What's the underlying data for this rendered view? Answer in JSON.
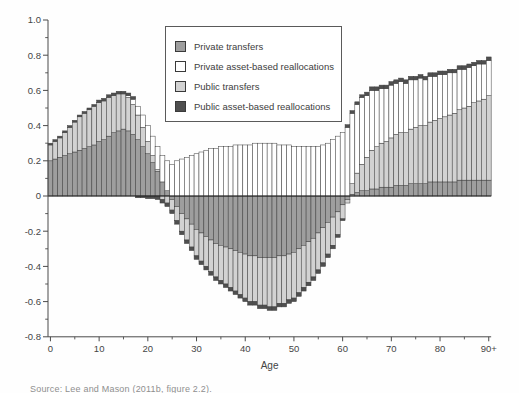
{
  "figure": {
    "source_note": "Source: Lee and Mason (2011b, figure 2.2)."
  },
  "colors": {
    "private_transfers": "#9e9e9e",
    "private_abr": "#ffffff",
    "public_transfers": "#d2d2d2",
    "public_abr": "#4f4f4f",
    "outline": "#3c3c3c",
    "axis": "#4a4a4a",
    "zero_line": "#222222",
    "text": "#454545"
  },
  "legend": {
    "items": [
      {
        "label": "Private transfers",
        "color_key": "private_transfers"
      },
      {
        "label": "Private asset-based reallocations",
        "color_key": "private_abr"
      },
      {
        "label": "Public transfers",
        "color_key": "public_transfers"
      },
      {
        "label": "Public asset-based reallocations",
        "color_key": "public_abr"
      }
    ]
  },
  "chart_data": {
    "type": "bar",
    "stacked": true,
    "title": "",
    "xlabel": "Age",
    "ylabel": "",
    "ylim": [
      -0.8,
      1.0
    ],
    "grid": false,
    "legend_position": "top-center-inside",
    "x_tick_ages": [
      0,
      10,
      20,
      30,
      40,
      50,
      60,
      70,
      80,
      90
    ],
    "x_tick_labels": [
      "0",
      "10",
      "20",
      "30",
      "40",
      "50",
      "60",
      "70",
      "80",
      "90+"
    ],
    "x_minor_tick_ages": [
      5,
      15,
      25,
      35,
      45,
      55,
      65,
      75,
      85
    ],
    "y_tick_values": [
      1.0,
      0.8,
      0.6,
      0.4,
      0.2,
      0,
      -0.2,
      -0.4,
      -0.6,
      -0.8
    ],
    "y_tick_labels": [
      "1.0",
      "0.8",
      "0.6",
      "0.4",
      "0.2",
      "0",
      "-0.2",
      "-0.4",
      "-0.6",
      "-0.8"
    ],
    "y_minor_tick_values": [
      0.9,
      0.7,
      0.5,
      0.3,
      0.1,
      -0.1,
      -0.3,
      -0.5,
      -0.7
    ],
    "ages": [
      0,
      1,
      2,
      3,
      4,
      5,
      6,
      7,
      8,
      9,
      10,
      11,
      12,
      13,
      14,
      15,
      16,
      17,
      18,
      19,
      20,
      21,
      22,
      23,
      24,
      25,
      26,
      27,
      28,
      29,
      30,
      31,
      32,
      33,
      34,
      35,
      36,
      37,
      38,
      39,
      40,
      41,
      42,
      43,
      44,
      45,
      46,
      47,
      48,
      49,
      50,
      51,
      52,
      53,
      54,
      55,
      56,
      57,
      58,
      59,
      60,
      61,
      62,
      63,
      64,
      65,
      66,
      67,
      68,
      69,
      70,
      71,
      72,
      73,
      74,
      75,
      76,
      77,
      78,
      79,
      80,
      81,
      82,
      83,
      84,
      85,
      86,
      87,
      88,
      89,
      90
    ],
    "stack_order": [
      "Private transfers",
      "Public transfers",
      "Private asset-based reallocations",
      "Public asset-based reallocations"
    ],
    "series": [
      {
        "name": "Private transfers",
        "color_key": "private_transfers",
        "values": [
          0.2,
          0.21,
          0.22,
          0.23,
          0.24,
          0.25,
          0.26,
          0.27,
          0.28,
          0.29,
          0.31,
          0.32,
          0.34,
          0.36,
          0.37,
          0.38,
          0.37,
          0.35,
          0.32,
          0.28,
          0.24,
          0.19,
          0.14,
          0.08,
          0.03,
          -0.02,
          -0.06,
          -0.1,
          -0.13,
          -0.16,
          -0.19,
          -0.21,
          -0.23,
          -0.25,
          -0.27,
          -0.28,
          -0.29,
          -0.3,
          -0.31,
          -0.32,
          -0.33,
          -0.34,
          -0.34,
          -0.35,
          -0.35,
          -0.35,
          -0.35,
          -0.34,
          -0.34,
          -0.33,
          -0.32,
          -0.3,
          -0.28,
          -0.26,
          -0.24,
          -0.21,
          -0.18,
          -0.15,
          -0.12,
          -0.09,
          -0.05,
          -0.02,
          0.01,
          0.02,
          0.03,
          0.03,
          0.04,
          0.04,
          0.05,
          0.05,
          0.05,
          0.06,
          0.06,
          0.06,
          0.07,
          0.07,
          0.07,
          0.07,
          0.08,
          0.08,
          0.08,
          0.08,
          0.08,
          0.08,
          0.09,
          0.09,
          0.09,
          0.09,
          0.09,
          0.09,
          0.09
        ]
      },
      {
        "name": "Private asset-based reallocations",
        "color_key": "private_abr",
        "values": [
          0,
          0,
          0,
          0,
          0,
          0,
          0,
          0,
          0,
          0,
          0,
          0,
          0,
          0,
          0,
          0,
          0.01,
          0.03,
          0.05,
          0.07,
          0.09,
          0.11,
          0.13,
          0.15,
          0.17,
          0.18,
          0.2,
          0.21,
          0.22,
          0.23,
          0.24,
          0.25,
          0.26,
          0.27,
          0.27,
          0.28,
          0.28,
          0.28,
          0.29,
          0.29,
          0.29,
          0.29,
          0.3,
          0.3,
          0.3,
          0.3,
          0.3,
          0.29,
          0.29,
          0.29,
          0.28,
          0.28,
          0.28,
          0.28,
          0.28,
          0.28,
          0.29,
          0.3,
          0.32,
          0.34,
          0.36,
          0.39,
          0.4,
          0.39,
          0.38,
          0.35,
          0.34,
          0.32,
          0.31,
          0.3,
          0.3,
          0.29,
          0.29,
          0.28,
          0.28,
          0.27,
          0.27,
          0.26,
          0.26,
          0.25,
          0.25,
          0.24,
          0.24,
          0.23,
          0.23,
          0.22,
          0.22,
          0.21,
          0.21,
          0.2,
          0.2
        ]
      },
      {
        "name": "Public transfers",
        "color_key": "public_transfers",
        "values": [
          0.09,
          0.1,
          0.11,
          0.13,
          0.15,
          0.17,
          0.19,
          0.2,
          0.21,
          0.22,
          0.22,
          0.22,
          0.22,
          0.21,
          0.21,
          0.2,
          0.19,
          0.17,
          0.14,
          0.11,
          0.07,
          0.04,
          0.01,
          -0.02,
          -0.04,
          -0.06,
          -0.08,
          -0.1,
          -0.12,
          -0.13,
          -0.15,
          -0.16,
          -0.17,
          -0.18,
          -0.19,
          -0.2,
          -0.21,
          -0.22,
          -0.23,
          -0.24,
          -0.25,
          -0.26,
          -0.26,
          -0.27,
          -0.27,
          -0.28,
          -0.28,
          -0.27,
          -0.27,
          -0.26,
          -0.26,
          -0.25,
          -0.24,
          -0.23,
          -0.22,
          -0.21,
          -0.2,
          -0.18,
          -0.16,
          -0.13,
          -0.08,
          -0.02,
          0.06,
          0.11,
          0.15,
          0.19,
          0.22,
          0.24,
          0.25,
          0.26,
          0.28,
          0.29,
          0.3,
          0.3,
          0.31,
          0.32,
          0.33,
          0.33,
          0.34,
          0.35,
          0.36,
          0.37,
          0.38,
          0.39,
          0.4,
          0.41,
          0.42,
          0.44,
          0.45,
          0.46,
          0.48
        ]
      },
      {
        "name": "Public asset-based reallocations",
        "color_key": "public_abr",
        "values": [
          0.01,
          0.01,
          0.01,
          0.01,
          0.01,
          0.01,
          0.01,
          0.01,
          0.01,
          0.01,
          0.015,
          0.015,
          0.015,
          0.015,
          0.015,
          0.015,
          0.015,
          0.015,
          -0.01,
          -0.01,
          -0.015,
          -0.015,
          -0.02,
          -0.02,
          -0.02,
          -0.02,
          -0.02,
          -0.02,
          -0.02,
          -0.02,
          -0.02,
          -0.02,
          -0.02,
          -0.02,
          -0.02,
          -0.02,
          -0.02,
          -0.02,
          -0.02,
          -0.02,
          -0.02,
          -0.02,
          -0.02,
          -0.02,
          -0.02,
          -0.02,
          -0.02,
          -0.02,
          -0.02,
          -0.02,
          -0.02,
          -0.02,
          -0.02,
          -0.02,
          -0.02,
          -0.02,
          -0.02,
          -0.02,
          -0.02,
          -0.015,
          -0.01,
          0.015,
          0.015,
          0.015,
          0.015,
          0.02,
          0.02,
          0.02,
          0.02,
          0.02,
          0.02,
          0.02,
          0.02,
          0.02,
          0.02,
          0.02,
          0.02,
          0.02,
          0.02,
          0.02,
          0.02,
          0.02,
          0.02,
          0.02,
          0.02,
          0.02,
          0.02,
          0.02,
          0.02,
          0.02,
          0.02
        ]
      }
    ]
  }
}
